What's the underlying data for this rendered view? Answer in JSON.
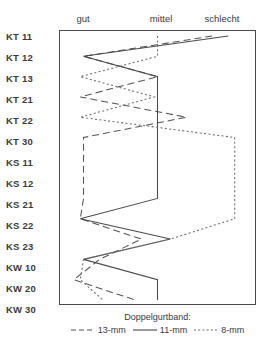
{
  "chart_data": {
    "type": "line",
    "title": "",
    "subtitle": "",
    "xlabel": "",
    "ylabel": "",
    "legend_title": "Doppelgurtband:",
    "legend_position": "bottom",
    "grid": false,
    "orientation": "horizontal-categories-vertical-items",
    "x_categories": [
      "gut",
      "mittel",
      "schlecht"
    ],
    "x_positions_px": [
      82,
      160,
      218
    ],
    "categories": [
      "KT 11",
      "KT 12",
      "KT 13",
      "KT 21",
      "KT 22",
      "KT 30",
      "KS 11",
      "KS 12",
      "KS 21",
      "KS 22",
      "KS 23",
      "KW 10",
      "KW 20",
      "KW 30"
    ],
    "xlim": [
      0,
      3
    ],
    "series": [
      {
        "name": "13-mm",
        "style": "dashed",
        "color": "#555555",
        "values": [
          2.35,
          0.35,
          1.5,
          0.3,
          1.95,
          0.35,
          0.35,
          0.35,
          0.35,
          0.3,
          1.25,
          0.6,
          0.2,
          1.15
        ]
      },
      {
        "name": "11-mm",
        "style": "solid",
        "color": "#4a4a4a",
        "values": [
          2.6,
          0.35,
          1.5,
          1.5,
          1.5,
          1.5,
          1.5,
          1.5,
          1.5,
          0.3,
          1.7,
          0.35,
          1.5,
          1.5
        ]
      },
      {
        "name": "8-mm",
        "style": "dotted",
        "color": "#6a6a6a",
        "values": [
          1.5,
          1.5,
          0.3,
          1.45,
          0.3,
          2.7,
          2.7,
          2.7,
          2.7,
          2.7,
          1.7,
          0.35,
          0.3,
          0.65
        ]
      }
    ]
  },
  "axis": {
    "row_labels": [
      "KT 11",
      "KT 12",
      "KT 13",
      "KT 21",
      "KT 22",
      "KT 30",
      "KS 11",
      "KS 12",
      "KS 21",
      "KS 22",
      "KS 23",
      "KW 10",
      "KW 20",
      "KW 30"
    ],
    "column_labels": [
      "gut",
      "mittel",
      "schlecht"
    ]
  },
  "legend": {
    "title": "Doppelgurtband:",
    "items": [
      {
        "label": "13-mm",
        "style": "dashed"
      },
      {
        "label": "11-mm",
        "style": "solid"
      },
      {
        "label": "8-mm",
        "style": "dotted"
      }
    ]
  }
}
